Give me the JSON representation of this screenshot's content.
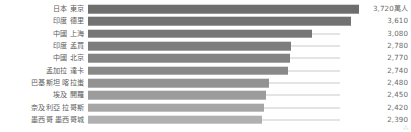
{
  "chart_data": {
    "type": "bar",
    "orientation": "horizontal",
    "title": "",
    "subtitle": "",
    "xlabel": "",
    "ylabel": "",
    "unit_label": "萬人",
    "grid": false,
    "legend": "none",
    "xlim": [
      0,
      3720
    ],
    "categories": [
      "日本 東京",
      "印度 德里",
      "中國 上海",
      "印度 孟買",
      "中國 北京",
      "孟加拉 達卡",
      "巴基斯坦 喀拉蚩",
      "埃及 開羅",
      "奈及利亞 拉哥斯",
      "墨西哥 墨西哥城"
    ],
    "values": [
      3720,
      3610,
      3080,
      2780,
      2770,
      2740,
      2480,
      2450,
      2420,
      2390
    ],
    "value_labels": [
      "3,720",
      "3,610",
      "3,080",
      "2,780",
      "2,770",
      "2,740",
      "2,480",
      "2,450",
      "2,420",
      "2,390"
    ],
    "bar_colors": [
      "#6e6e6e",
      "#727272",
      "#777777",
      "#7d7d7d",
      "#838383",
      "#898989",
      "#929292",
      "#9c9c9c",
      "#a6a6a6",
      "#b0b0b0"
    ],
    "leader_line_color": "#c9c9c9",
    "label_color": "#5d5d5d",
    "value_color": "#6b6b6b",
    "background": "#ffffff"
  },
  "watermark": "⁂"
}
